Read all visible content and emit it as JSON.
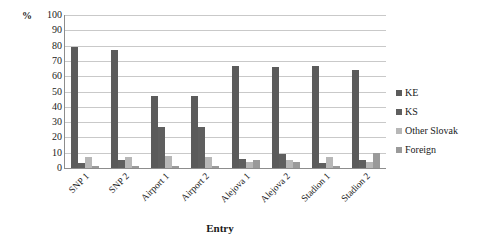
{
  "chart_data": {
    "type": "bar",
    "title": "",
    "xlabel": "Entry",
    "ylabel": "%",
    "ylim": [
      0,
      100
    ],
    "ytick_step": 10,
    "yticks": [
      100,
      90,
      80,
      70,
      60,
      50,
      40,
      30,
      20,
      10,
      0
    ],
    "grid": true,
    "legend_position": "right",
    "categories": [
      "SNP 1",
      "SNP 2",
      "Airport 1",
      "Airport 2",
      "Alejova 1",
      "Alejova 2",
      "Stadion 1",
      "Stadion 2"
    ],
    "series": [
      {
        "name": "KE",
        "color": "#5b5b5b",
        "values": [
          79,
          77,
          47,
          47,
          67,
          66,
          67,
          64
        ]
      },
      {
        "name": "KS",
        "color": "#5f5f5f",
        "values": [
          3,
          5,
          27,
          27,
          6,
          9,
          3,
          5
        ]
      },
      {
        "name": "Other Slovak",
        "color": "#b7b7b7",
        "values": [
          7,
          7,
          8,
          7,
          4,
          5,
          7,
          4
        ]
      },
      {
        "name": "Foreign",
        "color": "#9a9a9a",
        "values": [
          1,
          1,
          1,
          1,
          5,
          4,
          1,
          10
        ]
      }
    ]
  },
  "legend": {
    "items": [
      {
        "label": "KE"
      },
      {
        "label": "KS"
      },
      {
        "label": "Other Slovak"
      },
      {
        "label": "Foreign"
      }
    ]
  }
}
